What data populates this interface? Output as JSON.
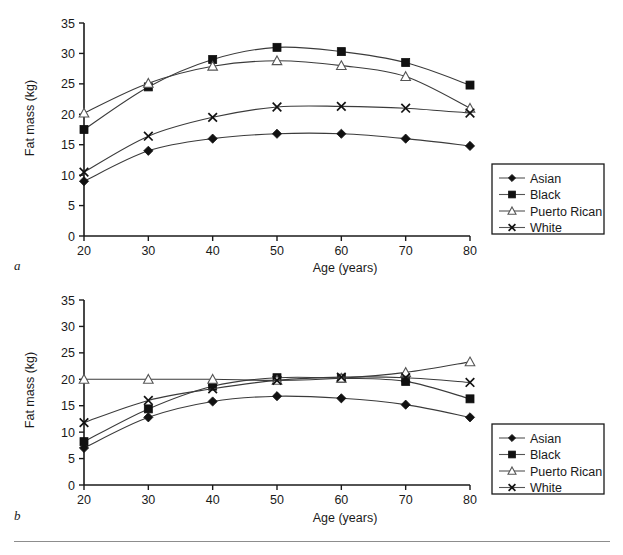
{
  "figure": {
    "panels": [
      {
        "letter": "a",
        "xlabel": "Age (years)",
        "ylabel": "Fat mass (kg)",
        "xticks": [
          "20",
          "30",
          "40",
          "50",
          "60",
          "70",
          "80"
        ],
        "yticks": [
          "0",
          "5",
          "10",
          "15",
          "20",
          "25",
          "30",
          "35"
        ]
      },
      {
        "letter": "b",
        "xlabel": "Age (years)",
        "ylabel": "Fat mass (kg)",
        "xticks": [
          "20",
          "30",
          "40",
          "50",
          "60",
          "70",
          "80"
        ],
        "yticks": [
          "0",
          "5",
          "10",
          "15",
          "20",
          "25",
          "30",
          "35"
        ]
      }
    ],
    "legend": {
      "entries": [
        {
          "label": "Asian",
          "marker": "diamond-filled-icon"
        },
        {
          "label": "Black",
          "marker": "square-filled-icon"
        },
        {
          "label": "Puerto Rican",
          "marker": "triangle-open-icon"
        },
        {
          "label": "White",
          "marker": "cross-icon"
        }
      ]
    }
  },
  "chart_data": [
    {
      "type": "line",
      "title": "",
      "panel": "a",
      "xlabel": "Age (years)",
      "ylabel": "Fat mass (kg)",
      "x": [
        20,
        30,
        40,
        50,
        60,
        70,
        80
      ],
      "xlim": [
        20,
        80
      ],
      "ylim": [
        0,
        35
      ],
      "xticks": [
        20,
        30,
        40,
        50,
        60,
        70,
        80
      ],
      "yticks": [
        0,
        5,
        10,
        15,
        20,
        25,
        30,
        35
      ],
      "grid": false,
      "legend_position": "right",
      "series": [
        {
          "name": "Asian",
          "marker": "diamond-filled",
          "values": [
            9.0,
            14.0,
            16.0,
            16.8,
            16.8,
            16.0,
            14.8
          ]
        },
        {
          "name": "Black",
          "marker": "square-filled",
          "values": [
            17.5,
            24.5,
            29.0,
            31.0,
            30.3,
            28.5,
            24.8
          ]
        },
        {
          "name": "Puerto Rican",
          "marker": "triangle-open",
          "values": [
            20.2,
            25.1,
            27.9,
            28.8,
            28.0,
            26.2,
            21.0
          ]
        },
        {
          "name": "White",
          "marker": "cross",
          "values": [
            10.5,
            16.4,
            19.5,
            21.2,
            21.3,
            21.0,
            20.2
          ]
        }
      ]
    },
    {
      "type": "line",
      "title": "",
      "panel": "b",
      "xlabel": "Age (years)",
      "ylabel": "Fat mass (kg)",
      "x": [
        20,
        30,
        40,
        50,
        60,
        70,
        80
      ],
      "xlim": [
        20,
        80
      ],
      "ylim": [
        0,
        35
      ],
      "xticks": [
        20,
        30,
        40,
        50,
        60,
        70,
        80
      ],
      "yticks": [
        0,
        5,
        10,
        15,
        20,
        25,
        30,
        35
      ],
      "grid": false,
      "legend_position": "right",
      "series": [
        {
          "name": "Asian",
          "marker": "diamond-filled",
          "values": [
            7.0,
            12.8,
            15.8,
            16.8,
            16.4,
            15.2,
            12.8
          ]
        },
        {
          "name": "Black",
          "marker": "square-filled",
          "values": [
            8.2,
            14.4,
            18.7,
            20.3,
            20.2,
            19.6,
            16.3
          ]
        },
        {
          "name": "Puerto Rican",
          "marker": "triangle-open",
          "values": [
            20.0,
            20.0,
            20.0,
            19.8,
            20.2,
            21.3,
            23.3
          ]
        },
        {
          "name": "White",
          "marker": "cross",
          "values": [
            11.8,
            16.0,
            18.2,
            19.8,
            20.4,
            20.3,
            19.4
          ]
        }
      ]
    }
  ]
}
